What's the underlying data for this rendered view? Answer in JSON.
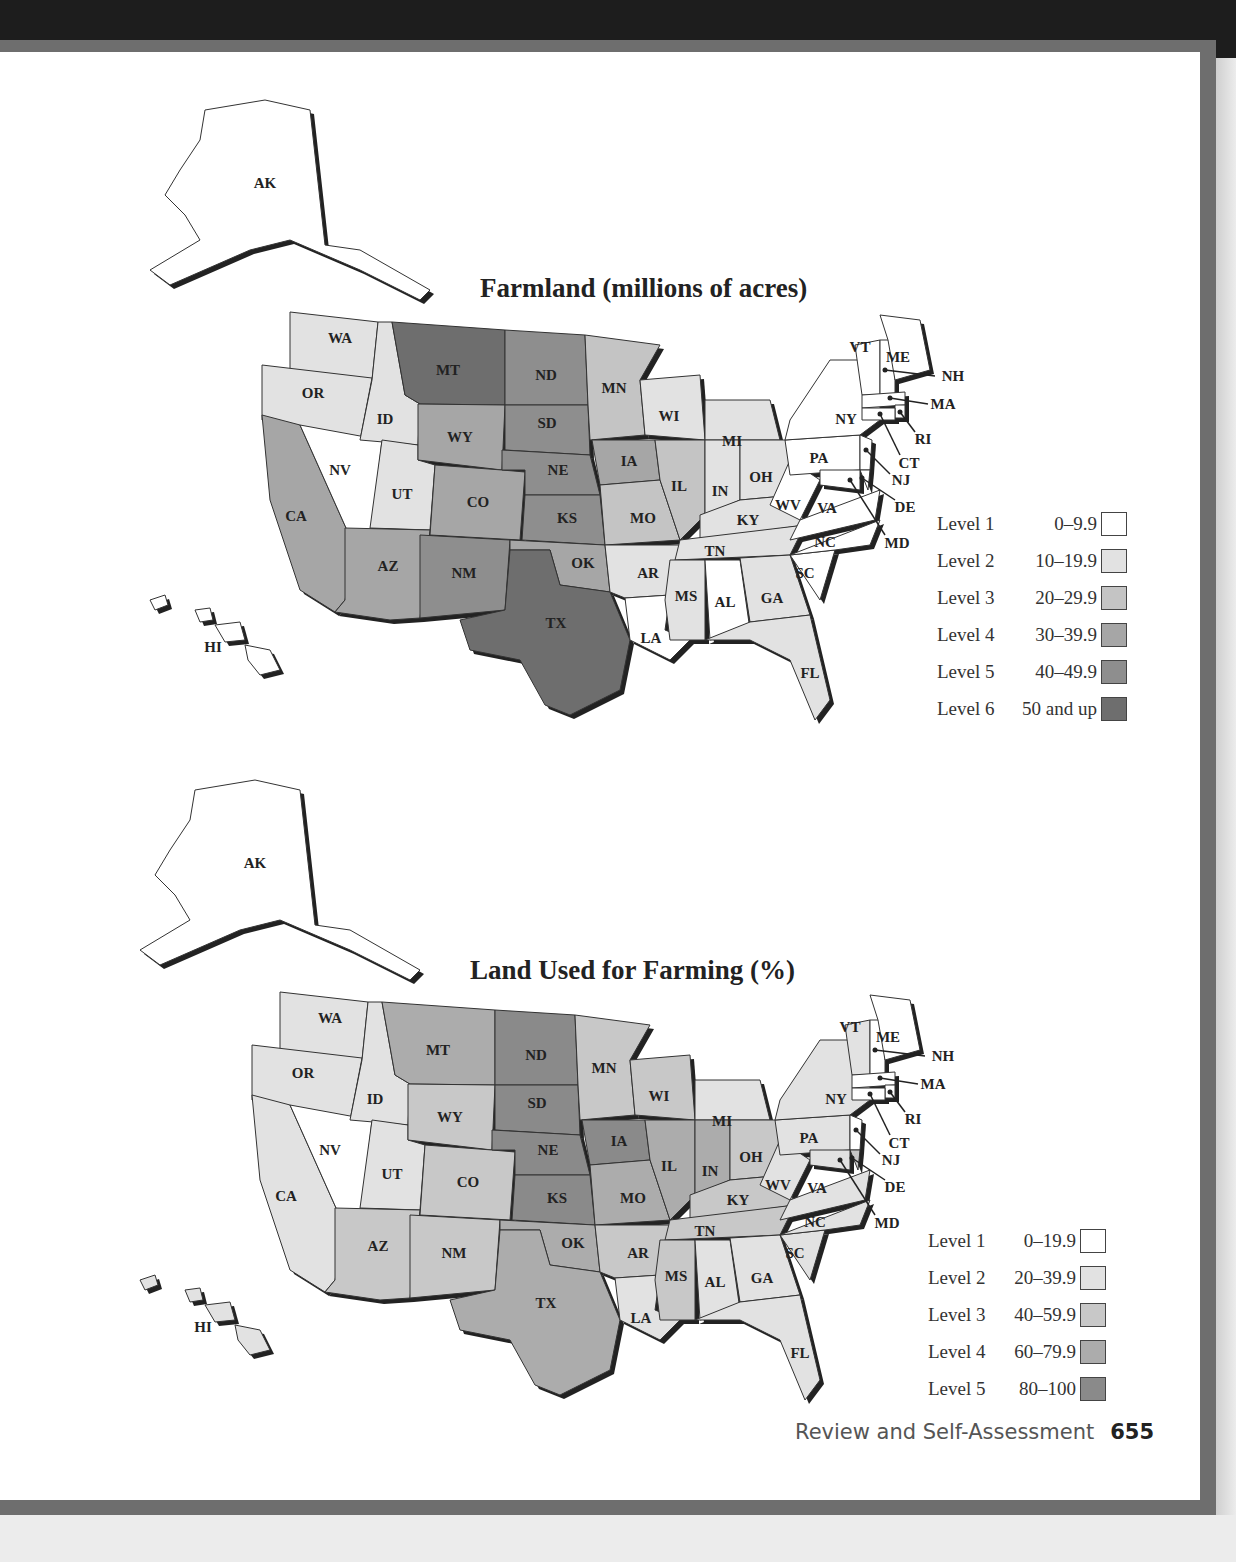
{
  "page": {
    "footer_text": "Review and Self-Assessment",
    "page_number": "655"
  },
  "maps": [
    {
      "title": "Farmland (millions of acres)",
      "legend": [
        {
          "level": "Level 1",
          "range": "0–9.9",
          "color": "#ffffff"
        },
        {
          "level": "Level 2",
          "range": "10–19.9",
          "color": "#e2e2e2"
        },
        {
          "level": "Level 3",
          "range": "20–29.9",
          "color": "#c4c4c4"
        },
        {
          "level": "Level 4",
          "range": "30–39.9",
          "color": "#a6a6a6"
        },
        {
          "level": "Level 5",
          "range": "40–49.9",
          "color": "#8e8e8e"
        },
        {
          "level": "Level 6",
          "range": "50 and up",
          "color": "#6e6e6e"
        }
      ],
      "states": {
        "AK": 1,
        "HI": 1,
        "WA": 2,
        "OR": 2,
        "CA": 4,
        "NV": 1,
        "ID": 2,
        "UT": 2,
        "AZ": 4,
        "MT": 6,
        "WY": 4,
        "CO": 4,
        "NM": 5,
        "ND": 5,
        "SD": 5,
        "NE": 5,
        "KS": 5,
        "OK": 4,
        "TX": 6,
        "MN": 3,
        "IA": 4,
        "MO": 3,
        "AR": 2,
        "LA": 1,
        "WI": 2,
        "IL": 3,
        "MI": 2,
        "IN": 2,
        "OH": 2,
        "KY": 2,
        "TN": 2,
        "MS": 2,
        "AL": 1,
        "GA": 2,
        "FL": 2,
        "SC": 1,
        "NC": 1,
        "VA": 1,
        "WV": 1,
        "PA": 1,
        "NY": 1,
        "VT": 1,
        "NH": 1,
        "ME": 1,
        "MA": 1,
        "RI": 1,
        "CT": 1,
        "NJ": 1,
        "DE": 1,
        "MD": 1
      }
    },
    {
      "title": "Land Used for Farming (%)",
      "legend": [
        {
          "level": "Level 1",
          "range": "0–19.9",
          "color": "#ffffff"
        },
        {
          "level": "Level 2",
          "range": "20–39.9",
          "color": "#e2e2e2"
        },
        {
          "level": "Level 3",
          "range": "40–59.9",
          "color": "#c8c8c8"
        },
        {
          "level": "Level 4",
          "range": "60–79.9",
          "color": "#acacac"
        },
        {
          "level": "Level 5",
          "range": "80–100",
          "color": "#8a8a8a"
        }
      ],
      "states": {
        "AK": 1,
        "HI": 2,
        "WA": 2,
        "OR": 2,
        "CA": 2,
        "NV": 1,
        "ID": 2,
        "UT": 2,
        "AZ": 3,
        "MT": 4,
        "WY": 3,
        "CO": 3,
        "NM": 3,
        "ND": 5,
        "SD": 5,
        "NE": 5,
        "KS": 5,
        "OK": 4,
        "TX": 4,
        "MN": 3,
        "IA": 5,
        "MO": 4,
        "AR": 3,
        "LA": 2,
        "WI": 3,
        "IL": 4,
        "MI": 2,
        "IN": 4,
        "OH": 3,
        "KY": 3,
        "TN": 3,
        "MS": 3,
        "AL": 2,
        "GA": 2,
        "FL": 2,
        "SC": 2,
        "NC": 2,
        "VA": 2,
        "WV": 2,
        "PA": 2,
        "NY": 2,
        "VT": 2,
        "NH": 1,
        "ME": 1,
        "MA": 1,
        "RI": 1,
        "CT": 1,
        "NJ": 1,
        "DE": 3,
        "MD": 2
      }
    }
  ],
  "state_labels": [
    "AK",
    "HI",
    "WA",
    "OR",
    "CA",
    "NV",
    "ID",
    "UT",
    "AZ",
    "MT",
    "WY",
    "CO",
    "NM",
    "ND",
    "SD",
    "NE",
    "KS",
    "OK",
    "TX",
    "MN",
    "IA",
    "MO",
    "AR",
    "LA",
    "WI",
    "IL",
    "MI",
    "IN",
    "OH",
    "KY",
    "TN",
    "MS",
    "AL",
    "GA",
    "FL",
    "SC",
    "NC",
    "VA",
    "WV",
    "PA",
    "NY",
    "VT",
    "NH",
    "ME",
    "MA",
    "RI",
    "CT",
    "NJ",
    "DE",
    "MD"
  ]
}
